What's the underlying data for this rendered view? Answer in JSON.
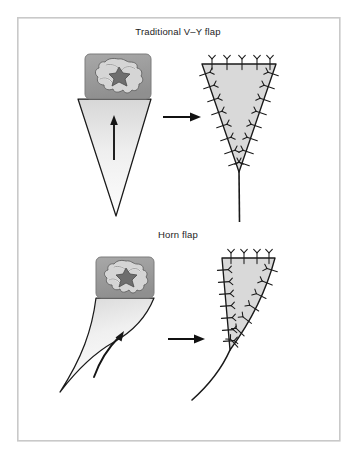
{
  "figure": {
    "background_color": "#ffffff",
    "frame": {
      "name": "figure-border",
      "x": 17,
      "y": 17,
      "width": 323,
      "height": 424,
      "stroke_color": "#c9c9c9",
      "stroke_width": 1.6,
      "fill": "#ffffff"
    },
    "stroke_color": "#1a1a1a",
    "panels": [
      {
        "id": "v-y-flap",
        "label": "Traditional V–Y flap",
        "label_x": 178,
        "label_y": 35,
        "before": {
          "name": "vy-flap-design",
          "description": "triangular V-Y advancement flap outline beneath lesion block",
          "triangle_points": "78,99 151,99 116,216",
          "fill_top_color": "#d7d7d7",
          "fill_bottom_color": "#fdfdfd",
          "arrow": {
            "name": "advancement-arrow-vy",
            "x": 114,
            "y_tail": 159,
            "y_head": 118,
            "color": "#151515"
          }
        },
        "lesion": {
          "name": "lesion-block-vy",
          "x": 85,
          "y": 54,
          "width": 66,
          "height": 45,
          "corner_radius": 5,
          "block_color": "#9b9b9b",
          "block_edge_color": "#7d7d7d",
          "petal_color": "#d5d5d5",
          "petal_edge_color": "#5c5c5c",
          "core_color": "#6e6e6e",
          "core_edge_color": "#4a4a4a"
        },
        "transition_arrow": {
          "name": "transition-arrow-vy",
          "x_tail": 163,
          "x_head": 201,
          "y": 117,
          "color": "#111111"
        },
        "after": {
          "name": "vy-flap-closure",
          "description": "sutured V triangle with vertical Y closure limb",
          "triangle_points": "202,64 276,64 239,172",
          "fill_color": "#d9d9d9",
          "tail": {
            "name": "vy-closure-limb",
            "x": 239,
            "y_top": 172,
            "y_bottom": 222
          },
          "suture_count": 24
        }
      },
      {
        "id": "horn-flap",
        "label": "Horn flap",
        "label_x": 178,
        "label_y": 238,
        "before": {
          "name": "horn-flap-design",
          "description": "curved horn-shaped advancement flap outline beneath lesion block",
          "fill_top_color": "#d7d7d7",
          "fill_bottom_color": "#fdfdfd",
          "arrow": {
            "name": "advancement-arrow-horn",
            "description": "curved arrow sweeping up and to the right",
            "color": "#151515"
          }
        },
        "lesion": {
          "name": "lesion-block-horn",
          "x": 96,
          "y": 257,
          "width": 58,
          "height": 41,
          "corner_radius": 5,
          "block_color": "#9b9b9b",
          "block_edge_color": "#7d7d7d",
          "petal_color": "#d5d5d5",
          "petal_edge_color": "#5c5c5c",
          "core_color": "#6e6e6e",
          "core_edge_color": "#4a4a4a"
        },
        "transition_arrow": {
          "name": "transition-arrow-horn",
          "x_tail": 168,
          "x_head": 205,
          "y": 339,
          "color": "#111111"
        },
        "after": {
          "name": "horn-flap-closure",
          "description": "sutured horn closure with straight left limb and curved right limb plus curved tail",
          "fill_color": "#d9d9d9",
          "suture_count": 24
        }
      }
    ]
  }
}
